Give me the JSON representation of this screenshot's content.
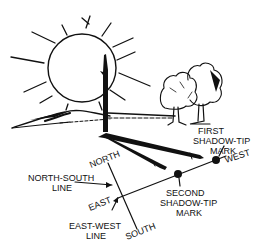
{
  "diagram": {
    "labels": {
      "first_mark_line1": "FIRST",
      "first_mark_line2": "SHADOW-TIP",
      "first_mark_line3": "MARK",
      "west": "WEST",
      "second_mark_line1": "SECOND",
      "second_mark_line2": "SHADOW-TIP",
      "second_mark_line3": "MARK",
      "north": "NORTH",
      "south": "SOUTH",
      "east": "EAST",
      "ns_line_line1": "NORTH-SOUTH",
      "ns_line_line2": "LINE",
      "ew_line_line1": "EAST-WEST",
      "ew_line_line2": "LINE"
    },
    "icons": [
      "sun-icon",
      "stick-icon",
      "trees-icon",
      "hill-icon"
    ],
    "colors": {
      "ink": "#111111",
      "background": "#ffffff"
    }
  }
}
